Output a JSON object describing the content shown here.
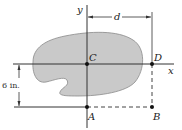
{
  "figure": {
    "axes": {
      "x_label": "x",
      "y_label": "y"
    },
    "points": {
      "C": "C",
      "D": "D",
      "A": "A",
      "B": "B"
    },
    "dimensions": {
      "horizontal": "d",
      "vertical": "6 in."
    },
    "colors": {
      "area_fill": "#c9c9c9",
      "area_stroke": "#8a8a8a",
      "line": "#333333"
    }
  }
}
